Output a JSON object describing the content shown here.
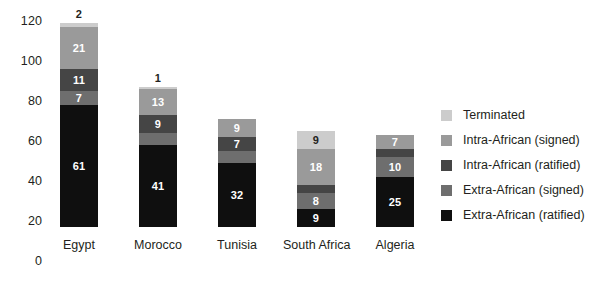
{
  "chart_data": {
    "type": "bar",
    "subtype": "stacked-bar",
    "title": "",
    "subtitle": "",
    "xlabel": "",
    "ylabel": "",
    "ylim": [
      0,
      120
    ],
    "ytick_values": [
      0,
      20,
      40,
      60,
      80,
      100,
      120
    ],
    "ytick_labels": [
      "0",
      "20",
      "40",
      "60",
      "80",
      "100",
      "120"
    ],
    "grid": false,
    "legend_position": "right",
    "categories": [
      "Egypt",
      "Morocco",
      "Tunisia",
      "South Africa",
      "Algeria"
    ],
    "series": [
      {
        "name": "Extra-African (ratified)",
        "color": "#0f0f0f",
        "label_color": "#ffffff",
        "values": [
          61,
          41,
          32,
          9,
          25
        ]
      },
      {
        "name": "Extra-African (signed)",
        "color": "#6e6e6e",
        "label_color": "#ffffff",
        "values": [
          7,
          6,
          6,
          8,
          10
        ]
      },
      {
        "name": "Intra-African (ratified)",
        "color": "#454545",
        "label_color": "#ffffff",
        "values": [
          11,
          9,
          7,
          4,
          4
        ]
      },
      {
        "name": "Intra-African (signed)",
        "color": "#9a9a9a",
        "label_color": "#ffffff",
        "values": [
          21,
          13,
          9,
          18,
          7
        ]
      },
      {
        "name": "Terminated",
        "color": "#cccccc",
        "label_color": "#231f20",
        "values": [
          2,
          1,
          0,
          9,
          0
        ]
      }
    ],
    "totals": [
      102,
      70,
      54,
      48,
      46
    ]
  },
  "legend": {
    "items": [
      {
        "label": "Terminated",
        "color": "#cccccc"
      },
      {
        "label": "Intra-African (signed)",
        "color": "#9a9a9a"
      },
      {
        "label": "Intra-African (ratified)",
        "color": "#454545"
      },
      {
        "label": "Extra-African (signed)",
        "color": "#6e6e6e"
      },
      {
        "label": "Extra-African (ratified)",
        "color": "#0f0f0f"
      }
    ]
  }
}
